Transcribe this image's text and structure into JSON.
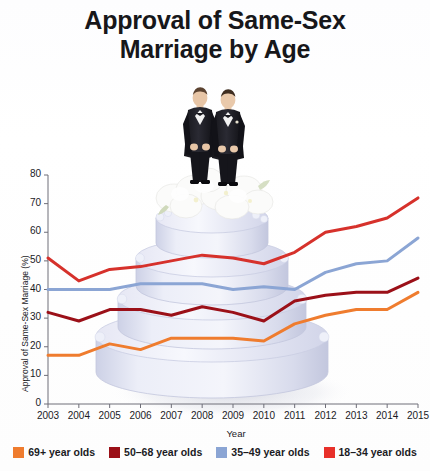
{
  "title_line1": "Approval of Same-Sex",
  "title_line2": "Marriage by Age",
  "chart_data": {
    "type": "line",
    "title": "Approval of Same-Sex Marriage by Age",
    "xlabel": "Year",
    "ylabel": "Approval of Same-Sex Marriage (%)",
    "xlim": [
      2003,
      2015
    ],
    "ylim": [
      0,
      80
    ],
    "ytick_step": 10,
    "yticks": [
      0,
      10,
      20,
      30,
      40,
      50,
      60,
      70,
      80
    ],
    "grid": false,
    "legend_position": "bottom",
    "categories": [
      2003,
      2004,
      2005,
      2006,
      2007,
      2008,
      2009,
      2010,
      2011,
      2012,
      2013,
      2014,
      2015
    ],
    "x": [
      "2003",
      "2004",
      "2005",
      "2006",
      "2007",
      "2008",
      "2009",
      "2010",
      "2011",
      "2012",
      "2013",
      "2014",
      "2015"
    ],
    "series": [
      {
        "name": "18–34 year olds",
        "color": "#d6312b",
        "values": [
          51,
          43,
          47,
          48,
          50,
          52,
          51,
          49,
          53,
          60,
          62,
          65,
          72
        ]
      },
      {
        "name": "35–49 year olds",
        "color": "#8ba5d4",
        "values": [
          40,
          40,
          40,
          42,
          42,
          42,
          40,
          41,
          40,
          46,
          49,
          50,
          58
        ]
      },
      {
        "name": "50–68 year olds",
        "color": "#9b1018",
        "values": [
          32,
          29,
          33,
          33,
          31,
          34,
          32,
          29,
          36,
          38,
          39,
          39,
          44
        ]
      },
      {
        "name": "69+ year olds",
        "color": "#ef7c2e",
        "values": [
          17,
          17,
          21,
          19,
          23,
          23,
          23,
          22,
          28,
          31,
          33,
          33,
          39
        ]
      }
    ]
  },
  "legend": [
    {
      "label": "69+ year olds",
      "color": "#ef7c2e"
    },
    {
      "label": "50–68 year olds",
      "color": "#9b1018"
    },
    {
      "label": "35–49 year olds",
      "color": "#8ba5d4"
    },
    {
      "label": "18–34 year olds",
      "color": "#e8302a"
    }
  ],
  "background_image": {
    "name": "wedding-cake-with-two-grooms",
    "tiers": 4,
    "topper": "two grooms in tuxedos",
    "flowers": "white flower arrangement"
  }
}
